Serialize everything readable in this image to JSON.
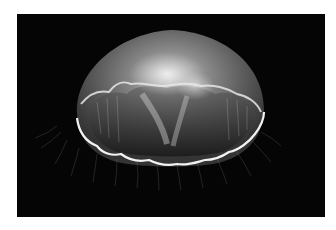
{
  "image": {
    "subject": "moon jellyfish",
    "alt": "Moon jellyfish photographed against a black background",
    "background_color": "#050505",
    "page_background": "#ffffff",
    "bell_color": "#d8d8d8",
    "rim_color": "#f2f2f2"
  }
}
